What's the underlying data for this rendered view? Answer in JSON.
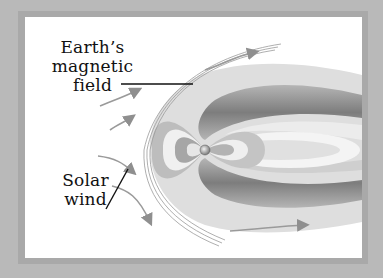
{
  "figure": {
    "labels": {
      "magnetic_field": [
        "Earth’s",
        "magnetic",
        "field"
      ],
      "solar_wind": [
        "Solar",
        "wind"
      ]
    },
    "elements": [
      "Earth",
      "magnetosphere",
      "bow shock",
      "solar wind arrows",
      "leader lines"
    ]
  },
  "colors": {
    "outer_frame": "#b9b9b9",
    "panel": "#ffffff",
    "field_dark": "#8a8a8a",
    "field_light": "#e8e8e8",
    "arrows": "#8f8f8f",
    "text": "#111111"
  }
}
